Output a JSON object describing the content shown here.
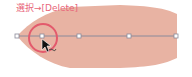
{
  "annotation": {
    "text": "選択→[Delete]",
    "color": "#e8657a"
  },
  "shape": {
    "fill": "#e8b3a3"
  },
  "path": {
    "stroke": "#8a8a9a",
    "anchors": [
      {
        "x": 17,
        "y": 36
      },
      {
        "x": 42,
        "y": 36
      },
      {
        "x": 79,
        "y": 36
      },
      {
        "x": 129,
        "y": 36
      },
      {
        "x": 176,
        "y": 36
      }
    ]
  },
  "highlight": {
    "color": "#e35a6c",
    "target_anchor_index": 1
  },
  "cursor": {
    "icon": "arrow-pointer-with-minus-icon"
  }
}
